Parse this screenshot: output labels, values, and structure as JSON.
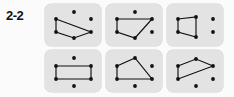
{
  "figure": {
    "exercise_label": "2-2",
    "background_color": "#fbfbfb",
    "panel_color": "#e3e3e3",
    "ink_color": "#111111",
    "rows": 2,
    "columns": 3,
    "panel_count": 6
  },
  "chart_data": {
    "type": "scatter",
    "title": "2-2",
    "xlabel": "",
    "ylabel": "",
    "panels": [
      {
        "id": "panel-1",
        "position": "top-left",
        "dots": [
          {
            "name": "dot-top-left",
            "x": 11,
            "y": 15
          },
          {
            "name": "dot-top-center",
            "x": 29,
            "y": 8
          },
          {
            "name": "dot-top-right",
            "x": 46,
            "y": 15
          },
          {
            "name": "dot-bottom-left",
            "x": 11,
            "y": 28
          },
          {
            "name": "dot-bottom-center",
            "x": 29,
            "y": 34
          },
          {
            "name": "dot-bottom-right",
            "x": 46,
            "y": 28
          }
        ],
        "shape": "quadrilateral",
        "vertices": [
          {
            "x": 11,
            "y": 15
          },
          {
            "x": 46,
            "y": 28
          },
          {
            "x": 29,
            "y": 34
          },
          {
            "x": 11,
            "y": 28
          }
        ],
        "unused_dots": [
          {
            "x": 29,
            "y": 8
          },
          {
            "x": 46,
            "y": 15
          }
        ]
      },
      {
        "id": "panel-2",
        "position": "top-center",
        "dots": [
          {
            "name": "dot-top-left",
            "x": 11,
            "y": 15
          },
          {
            "name": "dot-top-center",
            "x": 29,
            "y": 8
          },
          {
            "name": "dot-top-right",
            "x": 46,
            "y": 15
          },
          {
            "name": "dot-bottom-left",
            "x": 11,
            "y": 28
          },
          {
            "name": "dot-bottom-center",
            "x": 29,
            "y": 34
          },
          {
            "name": "dot-bottom-right",
            "x": 46,
            "y": 28
          }
        ],
        "shape": "quadrilateral",
        "vertices": [
          {
            "x": 11,
            "y": 15
          },
          {
            "x": 46,
            "y": 15
          },
          {
            "x": 29,
            "y": 34
          },
          {
            "x": 11,
            "y": 28
          }
        ],
        "unused_dots": [
          {
            "x": 29,
            "y": 8
          },
          {
            "x": 46,
            "y": 28
          }
        ]
      },
      {
        "id": "panel-3",
        "position": "top-right",
        "dots": [
          {
            "name": "dot-top-left",
            "x": 11,
            "y": 15
          },
          {
            "name": "dot-top-center",
            "x": 29,
            "y": 13
          },
          {
            "name": "dot-top-right",
            "x": 46,
            "y": 15
          },
          {
            "name": "dot-bottom-left",
            "x": 11,
            "y": 28
          },
          {
            "name": "dot-bottom-center",
            "x": 29,
            "y": 33
          },
          {
            "name": "dot-bottom-right",
            "x": 46,
            "y": 28
          }
        ],
        "shape": "quadrilateral",
        "vertices": [
          {
            "x": 11,
            "y": 15
          },
          {
            "x": 29,
            "y": 13
          },
          {
            "x": 29,
            "y": 33
          },
          {
            "x": 11,
            "y": 28
          }
        ],
        "unused_dots": [
          {
            "x": 46,
            "y": 15
          },
          {
            "x": 46,
            "y": 28
          }
        ]
      },
      {
        "id": "panel-4",
        "position": "bottom-left",
        "dots": [
          {
            "name": "dot-top-left",
            "x": 11,
            "y": 16
          },
          {
            "name": "dot-top-center",
            "x": 29,
            "y": 8
          },
          {
            "name": "dot-top-right",
            "x": 46,
            "y": 16
          },
          {
            "name": "dot-bottom-left",
            "x": 11,
            "y": 29
          },
          {
            "name": "dot-bottom-center",
            "x": 29,
            "y": 36
          },
          {
            "name": "dot-bottom-right",
            "x": 46,
            "y": 29
          }
        ],
        "shape": "rectangle",
        "vertices": [
          {
            "x": 11,
            "y": 16
          },
          {
            "x": 46,
            "y": 16
          },
          {
            "x": 46,
            "y": 29
          },
          {
            "x": 11,
            "y": 29
          }
        ],
        "unused_dots": [
          {
            "x": 29,
            "y": 8
          },
          {
            "x": 29,
            "y": 36
          }
        ]
      },
      {
        "id": "panel-5",
        "position": "bottom-center",
        "dots": [
          {
            "name": "dot-top-left",
            "x": 11,
            "y": 16
          },
          {
            "name": "dot-top-center",
            "x": 29,
            "y": 8
          },
          {
            "name": "dot-top-right",
            "x": 46,
            "y": 16
          },
          {
            "name": "dot-bottom-left",
            "x": 11,
            "y": 29
          },
          {
            "name": "dot-bottom-center",
            "x": 29,
            "y": 36
          },
          {
            "name": "dot-bottom-right",
            "x": 46,
            "y": 29
          }
        ],
        "shape": "quadrilateral",
        "vertices": [
          {
            "x": 11,
            "y": 16
          },
          {
            "x": 29,
            "y": 8
          },
          {
            "x": 46,
            "y": 29
          },
          {
            "x": 11,
            "y": 29
          }
        ],
        "unused_dots": [
          {
            "x": 46,
            "y": 16
          },
          {
            "x": 29,
            "y": 36
          }
        ]
      },
      {
        "id": "panel-6",
        "position": "bottom-right",
        "dots": [
          {
            "name": "dot-top-left",
            "x": 11,
            "y": 16
          },
          {
            "name": "dot-top-center",
            "x": 29,
            "y": 9
          },
          {
            "name": "dot-top-right",
            "x": 46,
            "y": 16
          },
          {
            "name": "dot-bottom-left",
            "x": 11,
            "y": 29
          },
          {
            "name": "dot-bottom-center",
            "x": 29,
            "y": 36
          },
          {
            "name": "dot-bottom-right",
            "x": 46,
            "y": 29
          }
        ],
        "shape": "parallelogram",
        "vertices": [
          {
            "x": 11,
            "y": 16
          },
          {
            "x": 29,
            "y": 9
          },
          {
            "x": 46,
            "y": 16
          },
          {
            "x": 11,
            "y": 29
          }
        ],
        "unused_dots": [
          {
            "x": 29,
            "y": 36
          },
          {
            "x": 46,
            "y": 29
          }
        ]
      }
    ]
  }
}
